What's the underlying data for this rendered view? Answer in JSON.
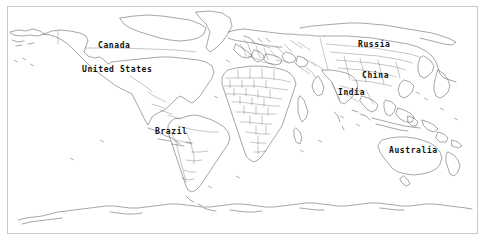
{
  "map": {
    "projection": "equirectangular",
    "background_color": "#ffffff",
    "coastline_color": "#3a3a3a",
    "border_color": "#5a5a5a",
    "frame_color": "#c8c8c8",
    "label_color": "#101010",
    "labels": [
      {
        "name": "Canada",
        "text": "Canada",
        "x": 98,
        "y": 41
      },
      {
        "name": "United States",
        "text": "United States",
        "x": 82,
        "y": 65
      },
      {
        "name": "Brazil",
        "text": "Brazil",
        "x": 155,
        "y": 127
      },
      {
        "name": "Russia",
        "text": "Russia",
        "x": 358,
        "y": 40
      },
      {
        "name": "China",
        "text": "China",
        "x": 362,
        "y": 71
      },
      {
        "name": "India",
        "text": "India",
        "x": 338,
        "y": 88
      },
      {
        "name": "Australia",
        "text": "Australia",
        "x": 389,
        "y": 146
      }
    ]
  }
}
